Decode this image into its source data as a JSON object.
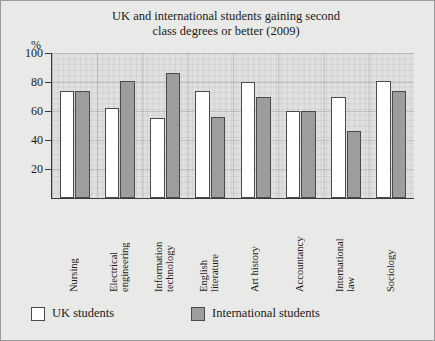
{
  "chart_data": {
    "type": "bar",
    "title": "UK and international students gaining second class degrees or better (2009)",
    "title_line1": "UK and international students gaining second",
    "title_line2": "class degrees or better (2009)",
    "xlabel": "",
    "ylabel": "%",
    "ylim": [
      0,
      100
    ],
    "yticks": [
      20,
      40,
      60,
      80,
      100
    ],
    "grid": true,
    "legend_position": "bottom",
    "categories": [
      "Nursing",
      "Electrical engineering",
      "Information technology",
      "English literature",
      "Art history",
      "Accountancy",
      "International law",
      "Sociology"
    ],
    "category_lines": [
      [
        "Nursing"
      ],
      [
        "Electrical",
        "engineering"
      ],
      [
        "Information",
        "technology"
      ],
      [
        "English",
        "literature"
      ],
      [
        "Art history"
      ],
      [
        "Accountancy"
      ],
      [
        "International",
        "law"
      ],
      [
        "Sociology"
      ]
    ],
    "series": [
      {
        "name": "UK students",
        "color": "#ffffff",
        "values": [
          74,
          62,
          55,
          74,
          80,
          60,
          70,
          81
        ]
      },
      {
        "name": "International students",
        "color": "#9d9d9d",
        "values": [
          74,
          81,
          86,
          56,
          70,
          60,
          46,
          74
        ]
      }
    ]
  },
  "legend": {
    "items": [
      {
        "label": "UK students",
        "swatch": "uk"
      },
      {
        "label": "International students",
        "swatch": "intl"
      }
    ]
  },
  "axis": {
    "unit_label": "%",
    "tick_labels": [
      "100",
      "80",
      "60",
      "40",
      "20"
    ]
  }
}
